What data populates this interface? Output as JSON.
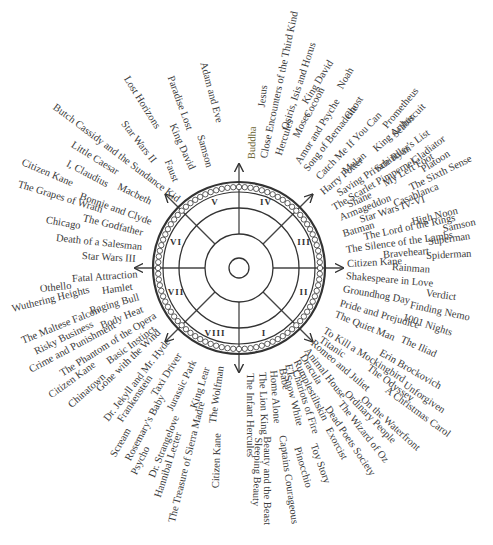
{
  "diagram": {
    "title": "",
    "center": {
      "x": 239,
      "y": 268
    },
    "sectors": [
      {
        "numeral": "I",
        "x": 264,
        "y": 333
      },
      {
        "numeral": "II",
        "x": 304,
        "y": 292
      },
      {
        "numeral": "III",
        "x": 304,
        "y": 242
      },
      {
        "numeral": "IV",
        "x": 266,
        "y": 202
      },
      {
        "numeral": "V",
        "x": 215,
        "y": 202
      },
      {
        "numeral": "VI",
        "x": 176,
        "y": 242
      },
      {
        "numeral": "VII",
        "x": 176,
        "y": 292
      },
      {
        "numeral": "VIII",
        "x": 215,
        "y": 333
      }
    ],
    "labels": [
      {
        "text": "Adam and Eve",
        "x": 203,
        "y": 62,
        "r": 75
      },
      {
        "text": "Paradise Lost",
        "x": 170,
        "y": 76,
        "r": 70
      },
      {
        "text": "Lost Horizons",
        "x": 126,
        "y": 77,
        "r": 58
      },
      {
        "text": "King David",
        "x": 172,
        "y": 124,
        "r": 66
      },
      {
        "text": "Samson",
        "x": 200,
        "y": 135,
        "r": 74
      },
      {
        "text": "Star Wars II",
        "x": 123,
        "y": 122,
        "r": 52
      },
      {
        "text": "Faust",
        "x": 167,
        "y": 160,
        "r": 68
      },
      {
        "text": "Butch Cassidy and the Sundance Kid",
        "x": 54,
        "y": 106,
        "r": 37
      },
      {
        "text": "Little Caesar",
        "x": 72,
        "y": 144,
        "r": 32
      },
      {
        "text": "Citizen Kane",
        "x": 22,
        "y": 162,
        "r": 23
      },
      {
        "text": "I, Claudius",
        "x": 67,
        "y": 163,
        "r": 28
      },
      {
        "text": "The Grapes of Wrath",
        "x": 18,
        "y": 184,
        "r": 17
      },
      {
        "text": "Macbeth",
        "x": 118,
        "y": 186,
        "r": 26
      },
      {
        "text": "Bonnie and Clyde",
        "x": 80,
        "y": 196,
        "r": 20
      },
      {
        "text": "The Godfather",
        "x": 83,
        "y": 218,
        "r": 14
      },
      {
        "text": "Chicago",
        "x": 46,
        "y": 220,
        "r": 10
      },
      {
        "text": "Death of a Salesman",
        "x": 56,
        "y": 238,
        "r": 6
      },
      {
        "text": "Star Wars III",
        "x": 82,
        "y": 256,
        "r": 3
      },
      {
        "text": "Fatal Attraction",
        "x": 72,
        "y": 279,
        "r": -4
      },
      {
        "text": "Othello",
        "x": 40,
        "y": 289,
        "r": -6
      },
      {
        "text": "Hamlet",
        "x": 102,
        "y": 291,
        "r": -8
      },
      {
        "text": "Wuthering Heights",
        "x": 12,
        "y": 309,
        "r": -14
      },
      {
        "text": "Raging Bull",
        "x": 90,
        "y": 311,
        "r": -16
      },
      {
        "text": "The Maltese Falcon",
        "x": 22,
        "y": 341,
        "r": -22
      },
      {
        "text": "Body Heat",
        "x": 101,
        "y": 326,
        "r": -22
      },
      {
        "text": "Risky Business",
        "x": 35,
        "y": 352,
        "r": -26
      },
      {
        "text": "Crime and Punishment",
        "x": 30,
        "y": 370,
        "r": -28
      },
      {
        "text": "The Phantom of the Opera",
        "x": 61,
        "y": 374,
        "r": -32
      },
      {
        "text": "Basic Instinct",
        "x": 108,
        "y": 362,
        "r": -36
      },
      {
        "text": "Citizen Kane",
        "x": 50,
        "y": 396,
        "r": -36
      },
      {
        "text": "Gone with the Wind",
        "x": 98,
        "y": 390,
        "r": -44
      },
      {
        "text": "Chinatown",
        "x": 70,
        "y": 406,
        "r": -42
      },
      {
        "text": "Dr. Jekyll and Mr. Hyde",
        "x": 106,
        "y": 420,
        "r": -52
      },
      {
        "text": "Frankenstein",
        "x": 120,
        "y": 421,
        "r": -56
      },
      {
        "text": "Taxi Driver",
        "x": 154,
        "y": 395,
        "r": -58
      },
      {
        "text": "Jurassic Park",
        "x": 170,
        "y": 410,
        "r": -64
      },
      {
        "text": "King Lear",
        "x": 194,
        "y": 408,
        "r": -72
      },
      {
        "text": "The Wolfman",
        "x": 213,
        "y": 423,
        "r": -82
      },
      {
        "text": "Scream",
        "x": 113,
        "y": 456,
        "r": -60
      },
      {
        "text": "Rosemary's Baby",
        "x": 128,
        "y": 460,
        "r": -62
      },
      {
        "text": "Psycho",
        "x": 134,
        "y": 474,
        "r": -64
      },
      {
        "text": "Dr. Strangelove",
        "x": 152,
        "y": 477,
        "r": -68
      },
      {
        "text": "Hannibal Lecter",
        "x": 158,
        "y": 497,
        "r": -72
      },
      {
        "text": "The Treasure of Sierra Madre",
        "x": 172,
        "y": 522,
        "r": -76
      },
      {
        "text": "Citizen Kane",
        "x": 216,
        "y": 488,
        "r": -88
      },
      {
        "text": "The Infant Hercules",
        "x": 250,
        "y": 373,
        "r": 90
      },
      {
        "text": "Sleeping Beauty",
        "x": 258,
        "y": 437,
        "r": 92
      },
      {
        "text": "The Lion King",
        "x": 262,
        "y": 372,
        "r": 88
      },
      {
        "text": "Home Alone",
        "x": 273,
        "y": 370,
        "r": 86
      },
      {
        "text": "Beauty and the Beast",
        "x": 267,
        "y": 436,
        "r": 90
      },
      {
        "text": "Babe",
        "x": 282,
        "y": 368,
        "r": 80
      },
      {
        "text": "ET",
        "x": 288,
        "y": 364,
        "r": 78
      },
      {
        "text": "Snow White",
        "x": 287,
        "y": 375,
        "r": 76
      },
      {
        "text": "Captains Courageous",
        "x": 282,
        "y": 435,
        "r": 82
      },
      {
        "text": "Chariots of Fire",
        "x": 295,
        "y": 370,
        "r": 72
      },
      {
        "text": "Pinocchio",
        "x": 297,
        "y": 447,
        "r": 74
      },
      {
        "text": "Rumplestiltskin",
        "x": 296,
        "y": 360,
        "r": 64
      },
      {
        "text": "Toy Story",
        "x": 313,
        "y": 444,
        "r": 70
      },
      {
        "text": "Dracula",
        "x": 302,
        "y": 355,
        "r": 58
      },
      {
        "text": "Exorcist",
        "x": 328,
        "y": 428,
        "r": 62
      },
      {
        "text": "Animal House",
        "x": 306,
        "y": 349,
        "r": 52
      },
      {
        "text": "Dead Poets Society",
        "x": 327,
        "y": 407,
        "r": 56
      },
      {
        "text": "The Wizard of Oz",
        "x": 340,
        "y": 402,
        "r": 52
      },
      {
        "text": "Ordinary People",
        "x": 346,
        "y": 392,
        "r": 46
      },
      {
        "text": "On the Waterfront",
        "x": 362,
        "y": 398,
        "r": 42
      },
      {
        "text": "Romeo and Juliet",
        "x": 312,
        "y": 342,
        "r": 40
      },
      {
        "text": "Titanic",
        "x": 320,
        "y": 339,
        "r": 34
      },
      {
        "text": "To Kill a Mockingbird",
        "x": 324,
        "y": 330,
        "r": 32
      },
      {
        "text": "The Odyssey",
        "x": 368,
        "y": 367,
        "r": 36
      },
      {
        "text": "A Christmas Carol",
        "x": 386,
        "y": 389,
        "r": 36
      },
      {
        "text": "Erin Brockovich",
        "x": 380,
        "y": 352,
        "r": 30
      },
      {
        "text": "Unforgiven",
        "x": 404,
        "y": 384,
        "r": 34
      },
      {
        "text": "The Quiet Man",
        "x": 335,
        "y": 314,
        "r": 22
      },
      {
        "text": "The Iliad",
        "x": 401,
        "y": 339,
        "r": 24
      },
      {
        "text": "Pride and Prejudice",
        "x": 340,
        "y": 303,
        "r": 16
      },
      {
        "text": "1001 Nights",
        "x": 403,
        "y": 317,
        "r": 18
      },
      {
        "text": "Groundhog Day",
        "x": 343,
        "y": 289,
        "r": 10
      },
      {
        "text": "Finding Nemo",
        "x": 410,
        "y": 305,
        "r": 12
      },
      {
        "text": "Verdict",
        "x": 426,
        "y": 293,
        "r": 8
      },
      {
        "text": "Shakespeare in Love",
        "x": 346,
        "y": 276,
        "r": 5
      },
      {
        "text": "Rainman",
        "x": 392,
        "y": 267,
        "r": 4
      },
      {
        "text": "Citizen Kane",
        "x": 347,
        "y": 264,
        "r": -3
      },
      {
        "text": "Braveheart",
        "x": 383,
        "y": 255,
        "r": -5
      },
      {
        "text": "Spiderman",
        "x": 426,
        "y": 256,
        "r": -3
      },
      {
        "text": "The Silence of the Lambs",
        "x": 346,
        "y": 250,
        "r": -8
      },
      {
        "text": "Superman",
        "x": 428,
        "y": 242,
        "r": -8
      },
      {
        "text": "The Lord of the Rings",
        "x": 364,
        "y": 237,
        "r": -12
      },
      {
        "text": "Samson",
        "x": 443,
        "y": 229,
        "r": -12
      },
      {
        "text": "High Noon",
        "x": 412,
        "y": 222,
        "r": -14
      },
      {
        "text": "Batman",
        "x": 343,
        "y": 234,
        "r": -16
      },
      {
        "text": "Star Wars IV-VI",
        "x": 360,
        "y": 220,
        "r": -18
      },
      {
        "text": "Armageddon",
        "x": 340,
        "y": 218,
        "r": -22
      },
      {
        "text": "Casablanca",
        "x": 394,
        "y": 204,
        "r": -22
      },
      {
        "text": "Shane",
        "x": 348,
        "y": 205,
        "r": -24
      },
      {
        "text": "The Sixth Sense",
        "x": 410,
        "y": 188,
        "r": -26
      },
      {
        "text": "The Scarlet Pimpernel",
        "x": 333,
        "y": 208,
        "r": -30
      },
      {
        "text": "My Left Foot",
        "x": 384,
        "y": 184,
        "r": -30
      },
      {
        "text": "Saving Private Ryan",
        "x": 338,
        "y": 194,
        "r": -33
      },
      {
        "text": "Platoon",
        "x": 422,
        "y": 170,
        "r": -32
      },
      {
        "text": "Schindler's List",
        "x": 376,
        "y": 170,
        "r": -36
      },
      {
        "text": "Gladiator",
        "x": 413,
        "y": 162,
        "r": -38
      },
      {
        "text": "Harry Potter",
        "x": 322,
        "y": 193,
        "r": -40
      },
      {
        "text": "Mulan",
        "x": 344,
        "y": 172,
        "r": -40
      },
      {
        "text": "King Arthur",
        "x": 375,
        "y": 150,
        "r": -42
      },
      {
        "text": "Catch Me If You Can",
        "x": 318,
        "y": 178,
        "r": -46
      },
      {
        "text": "Seabiscuit",
        "x": 394,
        "y": 136,
        "r": -46
      },
      {
        "text": "Prometheus",
        "x": 385,
        "y": 127,
        "r": -50
      },
      {
        "text": "Song of Bernadette",
        "x": 306,
        "y": 170,
        "r": -52
      },
      {
        "text": "Ghost",
        "x": 347,
        "y": 118,
        "r": -56
      },
      {
        "text": "Amor and Psyche",
        "x": 298,
        "y": 163,
        "r": -58
      },
      {
        "text": "Noah",
        "x": 340,
        "y": 88,
        "r": -60
      },
      {
        "text": "Moses",
        "x": 296,
        "y": 137,
        "r": -64
      },
      {
        "text": "Cocoon",
        "x": 307,
        "y": 117,
        "r": -62
      },
      {
        "text": "King David",
        "x": 305,
        "y": 103,
        "r": -58
      },
      {
        "text": "Hercules",
        "x": 279,
        "y": 155,
        "r": -72
      },
      {
        "text": "Osiris, Isis and Horus",
        "x": 285,
        "y": 129,
        "r": -72
      },
      {
        "text": "Close Encounters of the Third Kind",
        "x": 264,
        "y": 158,
        "r": -78
      },
      {
        "text": "Jesus",
        "x": 262,
        "y": 107,
        "r": -84
      },
      {
        "text": "Buddha",
        "x": 252,
        "y": 159,
        "r": -88,
        "accent": true
      }
    ]
  }
}
